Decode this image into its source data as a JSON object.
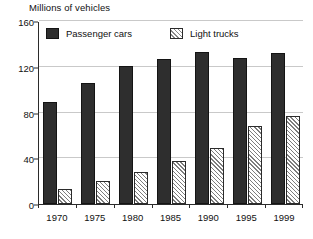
{
  "chart_data": {
    "type": "bar",
    "title": "Millions of vehicles",
    "xlabel": "",
    "ylabel": "Millions of vehicles",
    "categories": [
      "1970",
      "1975",
      "1980",
      "1985",
      "1990",
      "1995",
      "1999"
    ],
    "series": [
      {
        "name": "Passenger cars",
        "color": "#2e2e2e",
        "fill": "solid",
        "values": [
          89,
          106,
          121,
          127,
          133,
          128,
          132
        ]
      },
      {
        "name": "Light trucks",
        "color": "#ffffff",
        "fill": "diagonal-hatch",
        "values": [
          13,
          20,
          28,
          38,
          49,
          68,
          77
        ]
      }
    ],
    "yticks": [
      0,
      40,
      80,
      120,
      160
    ],
    "ylim": [
      0,
      160
    ],
    "grid": true,
    "legend_position": "top-inside"
  },
  "legend": {
    "items": [
      {
        "label": "Passenger cars",
        "swatch": "solid-dark-square"
      },
      {
        "label": "Light trucks",
        "swatch": "hatched-square"
      }
    ]
  }
}
